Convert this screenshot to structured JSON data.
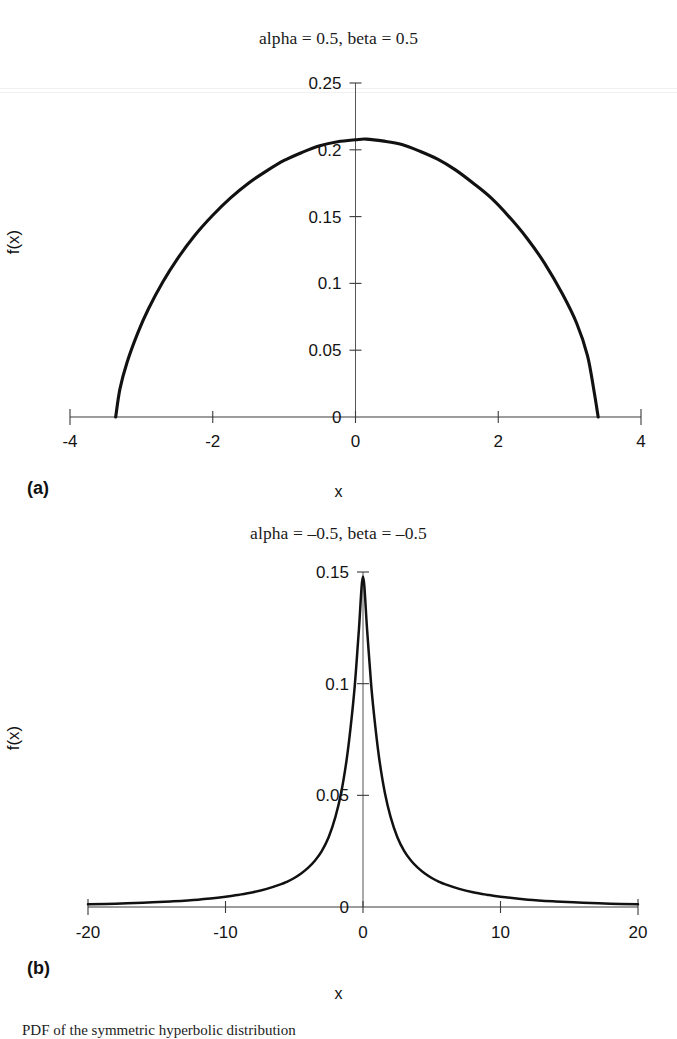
{
  "figure": {
    "caption": "PDF of the symmetric hyperbolic distribution",
    "panels": [
      {
        "tag": "(a)"
      },
      {
        "tag": "(b)"
      }
    ]
  },
  "chart_data": [
    {
      "type": "line",
      "panel": "(a)",
      "title": "alpha = 0.5, beta = 0.5",
      "xlabel": "x",
      "ylabel": "f(x)",
      "xlim": [
        -4,
        4
      ],
      "ylim": [
        0,
        0.25
      ],
      "xticks": [
        -4,
        -2,
        0,
        2,
        4
      ],
      "xticklabels": [
        "-4",
        "-2",
        "0",
        "2",
        "4"
      ],
      "yticks": [
        0,
        0.05,
        0.1,
        0.15,
        0.2,
        0.25
      ],
      "yticklabels": [
        "0",
        "0.05",
        "0.1",
        "0.15",
        "0.2",
        "0.25"
      ],
      "grid": false,
      "legend": null,
      "series": [
        {
          "name": "f(x)",
          "x": [
            -3.36,
            -3.3,
            -3.2,
            -3.05,
            -2.9,
            -2.7,
            -2.5,
            -2.25,
            -2.0,
            -1.75,
            -1.5,
            -1.25,
            -1.0,
            -0.75,
            -0.5,
            -0.25,
            0.0,
            0.15,
            0.4,
            0.65,
            0.9,
            1.15,
            1.4,
            1.65,
            1.9,
            2.15,
            2.4,
            2.65,
            2.9,
            3.1,
            3.25,
            3.34,
            3.4
          ],
          "y": [
            0.0,
            0.021,
            0.041,
            0.063,
            0.081,
            0.101,
            0.118,
            0.136,
            0.151,
            0.164,
            0.175,
            0.184,
            0.192,
            0.198,
            0.203,
            0.206,
            0.2075,
            0.208,
            0.2065,
            0.204,
            0.199,
            0.193,
            0.185,
            0.175,
            0.164,
            0.15,
            0.134,
            0.115,
            0.092,
            0.07,
            0.046,
            0.02,
            0.0
          ]
        }
      ]
    },
    {
      "type": "line",
      "panel": "(b)",
      "title": "alpha = –0.5, beta = –0.5",
      "xlabel": "x",
      "ylabel": "f(x)",
      "xlim": [
        -20,
        20
      ],
      "ylim": [
        0,
        0.15
      ],
      "xticks": [
        -20,
        -10,
        0,
        10,
        20
      ],
      "xticklabels": [
        "-20",
        "-10",
        "0",
        "10",
        "20"
      ],
      "yticks": [
        0,
        0.05,
        0.1,
        0.15
      ],
      "yticklabels": [
        "0",
        "0.05",
        "0.1",
        "0.15"
      ],
      "grid": false,
      "legend": null,
      "series": [
        {
          "name": "f(x)",
          "x": [
            -20,
            -18,
            -16,
            -14,
            -12,
            -10,
            -9,
            -8,
            -7,
            -6,
            -5.5,
            -5,
            -4.5,
            -4,
            -3.5,
            -3,
            -2.5,
            -2,
            -1.6,
            -1.2,
            -0.9,
            -0.6,
            -0.3,
            0,
            0.3,
            0.6,
            0.9,
            1.2,
            1.6,
            2,
            2.5,
            3,
            3.5,
            4,
            4.5,
            5,
            5.5,
            6,
            7,
            8,
            9,
            10,
            12,
            14,
            16,
            18,
            20
          ],
          "y": [
            0.0012,
            0.0015,
            0.0019,
            0.0025,
            0.0033,
            0.0046,
            0.0055,
            0.0066,
            0.0081,
            0.0101,
            0.0114,
            0.013,
            0.015,
            0.0175,
            0.0207,
            0.025,
            0.0312,
            0.0405,
            0.0508,
            0.0655,
            0.0805,
            0.099,
            0.124,
            0.148,
            0.124,
            0.099,
            0.0805,
            0.0655,
            0.0508,
            0.0405,
            0.0312,
            0.025,
            0.0207,
            0.0175,
            0.015,
            0.013,
            0.0114,
            0.0101,
            0.0081,
            0.0066,
            0.0055,
            0.0046,
            0.0033,
            0.0025,
            0.0019,
            0.0015,
            0.0012
          ]
        }
      ]
    }
  ]
}
